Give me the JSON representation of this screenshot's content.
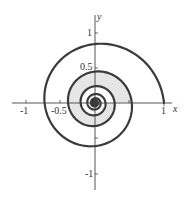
{
  "chart_data": {
    "type": "line",
    "title": "",
    "xlabel": "x",
    "ylabel": "y",
    "xlim": [
      -1.3,
      1.3
    ],
    "ylim": [
      -1.3,
      1.3
    ],
    "x_ticks": [
      -1,
      -0.5,
      0.5,
      1
    ],
    "y_ticks": [
      -1,
      -0.5,
      0.5,
      1
    ],
    "x_tick_labels": [
      "-1",
      "-0.5",
      "1"
    ],
    "y_tick_labels": [
      "1",
      "0.5",
      "-1"
    ],
    "grid": false,
    "legend": null,
    "series": [
      {
        "name": "spiral",
        "equation": "r = e^(-0.1 theta)",
        "theta_range": [
          0,
          56
        ],
        "axis_crossings": {
          "positive_x": [
            1.0,
            0.57,
            0.3,
            0.16
          ],
          "positive_y": [
            0.91
          ],
          "negative_x": [
            -0.74,
            -0.4
          ],
          "negative_y": [
            -0.64,
            -0.37
          ]
        }
      }
    ],
    "shaded_region": {
      "description": "area between second and third turn of the spiral",
      "theta_outer_range": [
        6.283,
        12.566
      ],
      "theta_inner_range": [
        12.566,
        18.85
      ]
    }
  },
  "labels": {
    "x_axis": "x",
    "y_axis": "y",
    "x_neg1": "-1",
    "x_neg05": "-0.5",
    "x_pos1": "1",
    "y_pos1": "1",
    "y_pos05": "0.5",
    "y_neg1": "-1"
  },
  "colors": {
    "curve": "#3a3a3a",
    "shade": "#e6e6e6",
    "axis": "#444444"
  }
}
